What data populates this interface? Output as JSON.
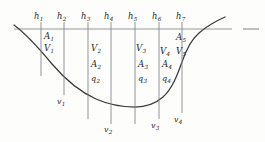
{
  "figure": {
    "type": "open-channel-cross-section",
    "background_color": "#fdfdfc",
    "ink_color": "#25262a",
    "line_color": "#6d6f73",
    "width": 265,
    "height": 142
  },
  "waterline": {
    "label": "water-surface-line",
    "y": 29,
    "x_start": 14,
    "x_end": 232,
    "dash": {
      "x_start": 243,
      "x_end": 259,
      "y": 29
    }
  },
  "bed": {
    "label": "channel-bed-profile",
    "description": "concave channel bed from left bank down to flat bottom and up the steeper right bank"
  },
  "depth_labels": [
    {
      "text": "h",
      "sub": "1",
      "x": 38,
      "y": 12
    },
    {
      "text": "h",
      "sub": "2",
      "x": 61,
      "y": 12
    },
    {
      "text": "h",
      "sub": "3",
      "x": 85,
      "y": 12
    },
    {
      "text": "h",
      "sub": "4",
      "x": 108,
      "y": 12
    },
    {
      "text": "h",
      "sub": "5",
      "x": 132,
      "y": 12
    },
    {
      "text": "h",
      "sub": "6",
      "x": 156,
      "y": 12
    },
    {
      "text": "h",
      "sub": "7",
      "x": 180,
      "y": 12
    }
  ],
  "verticals": [
    {
      "name": "vertical-1",
      "x": 41,
      "y_top": 22,
      "y_bottom": 76
    },
    {
      "name": "vertical-2",
      "x": 64,
      "y_top": 22,
      "y_bottom": 95
    },
    {
      "name": "vertical-3",
      "x": 88,
      "y_top": 22,
      "y_bottom": 119
    },
    {
      "name": "vertical-4",
      "x": 111,
      "y_top": 22,
      "y_bottom": 124
    },
    {
      "name": "vertical-5",
      "x": 135,
      "y_top": 22,
      "y_bottom": 124
    },
    {
      "name": "vertical-6",
      "x": 159,
      "y_top": 22,
      "y_bottom": 119
    },
    {
      "name": "vertical-7",
      "x": 182,
      "y_top": 22,
      "y_bottom": 113
    }
  ],
  "area_labels": [
    {
      "text": "A",
      "sub": "1",
      "x": 44,
      "y": 33
    },
    {
      "text": "A",
      "sub": "2",
      "x": 91,
      "y": 61
    },
    {
      "text": "A",
      "sub": "3",
      "x": 138,
      "y": 61
    },
    {
      "text": "A",
      "sub": "4",
      "x": 162,
      "y": 61
    },
    {
      "text": "A",
      "sub": "5",
      "x": 176,
      "y": 34
    }
  ],
  "velocity_labels": [
    {
      "text": "V",
      "sub": "1",
      "x": 44,
      "y": 45
    },
    {
      "text": "V",
      "sub": "2",
      "x": 91,
      "y": 45
    },
    {
      "text": "V",
      "sub": "3",
      "x": 136,
      "y": 45
    },
    {
      "text": "V",
      "sub": "4",
      "x": 160,
      "y": 48
    },
    {
      "text": "V",
      "sub": "5",
      "x": 176,
      "y": 48
    }
  ],
  "discharge_labels": [
    {
      "text": "q",
      "sub": "2",
      "x": 91,
      "y": 76
    },
    {
      "text": "q",
      "sub": "3",
      "x": 138,
      "y": 76
    },
    {
      "text": "q",
      "sub": "4",
      "x": 162,
      "y": 76
    }
  ],
  "bed_velocity_labels": [
    {
      "text": "v",
      "sub": "1",
      "x": 58,
      "y": 99
    },
    {
      "text": "v",
      "sub": "2",
      "x": 105,
      "y": 127
    },
    {
      "text": "v",
      "sub": "3",
      "x": 152,
      "y": 123
    },
    {
      "text": "v",
      "sub": "4",
      "x": 175,
      "y": 117
    }
  ]
}
